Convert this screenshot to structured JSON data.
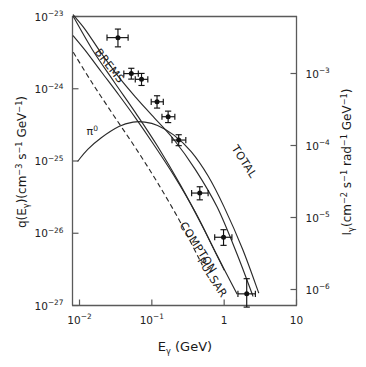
{
  "figure": {
    "background_color": "#ffffff",
    "line_color": "#2a2a2a",
    "axis_color": "#5a5a5a",
    "marker_color": "#111111"
  },
  "axes": {
    "x": {
      "label_parts": {
        "symbol": "E",
        "subscript": "γ",
        "units": "(GeV)"
      },
      "label_text": "Eγ (GeV)",
      "scale": "log",
      "range": [
        0.008,
        10
      ],
      "ticks": [
        {
          "value": 0.01,
          "mantissa": "10",
          "exponent": "-2"
        },
        {
          "value": 0.1,
          "mantissa": "10",
          "exponent": "-1"
        },
        {
          "value": 1,
          "mantissa": "1",
          "exponent": ""
        },
        {
          "value": 10,
          "mantissa": "10",
          "exponent": ""
        }
      ]
    },
    "y_left": {
      "label_text": "q(Eγ)(cm⁻³ s⁻¹ GeV⁻¹)",
      "scale": "log",
      "range": [
        1e-27,
        1e-23
      ],
      "ticks": [
        {
          "mantissa": "10",
          "exponent": "-23"
        },
        {
          "mantissa": "10",
          "exponent": "-24"
        },
        {
          "mantissa": "10",
          "exponent": "-25"
        },
        {
          "mantissa": "10",
          "exponent": "-26"
        },
        {
          "mantissa": "10",
          "exponent": "-27"
        }
      ]
    },
    "y_right": {
      "label_text": "Iγ(cm⁻² s⁻¹ rad⁻¹ GeV⁻¹)",
      "scale": "log",
      "ticks": [
        {
          "mantissa": "10",
          "exponent": "-3"
        },
        {
          "mantissa": "10",
          "exponent": "-4"
        },
        {
          "mantissa": "10",
          "exponent": "-5"
        },
        {
          "mantissa": "10",
          "exponent": "-6"
        }
      ]
    }
  },
  "chart_data": {
    "type": "line",
    "title": "",
    "xlabel": "Eγ (GeV)",
    "ylabel": "q(Eγ)(cm⁻³ s⁻¹ GeV⁻¹)",
    "ylabel_right": "Iγ(cm⁻² s⁻¹ rad⁻¹ GeV⁻¹)",
    "xscale": "log",
    "yscale": "log",
    "xlim": [
      0.008,
      10
    ],
    "ylim": [
      1e-27,
      1e-23
    ],
    "grid": false,
    "legend": "inline-curve-labels",
    "annotations": [
      {
        "text": "BREMS",
        "x": 0.016,
        "y": 3.2e-24,
        "rotation": 52
      },
      {
        "text": "π⁰",
        "x": 0.0125,
        "y": 2.3e-25,
        "rotation": 0
      },
      {
        "text": "COMPTON",
        "x": 0.24,
        "y": 1.3e-26,
        "rotation": 57
      },
      {
        "text": "PULSAR",
        "x": 0.42,
        "y": 4.2e-27,
        "rotation": 57
      },
      {
        "text": "TOTAL",
        "x": 1.25,
        "y": 1.5e-25,
        "rotation": 57
      }
    ],
    "series": [
      {
        "name": "BREMS",
        "style": "solid",
        "x": [
          0.0082,
          0.012,
          0.02,
          0.035,
          0.06,
          0.1,
          0.2,
          0.4,
          0.8,
          1.5,
          2.5,
          3.6
        ],
        "y": [
          5.4e-24,
          3.4e-24,
          1.72e-24,
          8.2e-25,
          3.9e-25,
          1.85e-25,
          6.4e-26,
          1.95e-26,
          4.9e-27,
          1.45e-27,
          4.6e-28,
          2e-28
        ]
      },
      {
        "name": "PI0",
        "style": "solid",
        "x": [
          0.0095,
          0.013,
          0.02,
          0.035,
          0.055,
          0.08,
          0.12,
          0.2,
          0.35,
          0.6,
          1.0,
          1.8,
          3.0,
          4.3
        ],
        "y": [
          1e-25,
          1.45e-25,
          2.1e-25,
          3e-25,
          3.45e-25,
          3.45e-25,
          3.1e-25,
          2.3e-25,
          1.35e-25,
          6.2e-26,
          2.3e-26,
          6e-27,
          1.5e-27,
          5.5e-28
        ]
      },
      {
        "name": "COMPTON",
        "style": "solid",
        "x": [
          0.0082,
          0.015,
          0.03,
          0.06,
          0.12,
          0.25,
          0.5,
          1.0,
          1.8,
          2.8,
          3.6
        ],
        "y": [
          1e-23,
          3.5e-24,
          1.25e-24,
          4.6e-25,
          1.6e-25,
          4.6e-26,
          1.25e-26,
          3.1e-27,
          8.5e-28,
          2.7e-28,
          1.4e-28
        ]
      },
      {
        "name": "PULSAR",
        "style": "dashed",
        "x": [
          0.0082,
          0.015,
          0.03,
          0.06,
          0.12,
          0.25,
          0.5,
          1.0,
          1.6,
          2.3
        ],
        "y": [
          3.2e-24,
          1.2e-24,
          4.2e-25,
          1.5e-25,
          5e-26,
          1.4e-26,
          3.6e-27,
          8.5e-28,
          3e-28,
          1.2e-28
        ]
      },
      {
        "name": "TOTAL",
        "style": "solid",
        "x": [
          0.0082,
          0.012,
          0.02,
          0.035,
          0.06,
          0.1,
          0.2,
          0.4,
          0.8,
          1.5,
          2.5,
          4.0
        ],
        "y": [
          1.05e-23,
          6.6e-24,
          3.1e-24,
          1.45e-24,
          7.6e-25,
          4.3e-25,
          2e-25,
          7.6e-26,
          2.3e-26,
          5.2e-27,
          1.35e-27,
          3e-28
        ]
      }
    ],
    "data_points": [
      {
        "x": 0.034,
        "y": 5.1e-24,
        "xerr_lo": 0.01,
        "xerr_hi": 0.013,
        "yerr_lo": 1.3e-24,
        "yerr_hi": 1.6e-24
      },
      {
        "x": 0.052,
        "y": 1.62e-24,
        "xerr_lo": 0.011,
        "xerr_hi": 0.013,
        "yerr_lo": 2.6e-25,
        "yerr_hi": 3e-25
      },
      {
        "x": 0.072,
        "y": 1.35e-24,
        "xerr_lo": 0.013,
        "xerr_hi": 0.016,
        "yerr_lo": 2.4e-25,
        "yerr_hi": 2.8e-25
      },
      {
        "x": 0.118,
        "y": 6.6e-25,
        "xerr_lo": 0.02,
        "xerr_hi": 0.026,
        "yerr_lo": 1.2e-25,
        "yerr_hi": 1.4e-25
      },
      {
        "x": 0.168,
        "y": 4.1e-25,
        "xerr_lo": 0.03,
        "xerr_hi": 0.04,
        "yerr_lo": 7e-26,
        "yerr_hi": 8e-26
      },
      {
        "x": 0.235,
        "y": 1.95e-25,
        "xerr_lo": 0.045,
        "xerr_hi": 0.06,
        "yerr_lo": 3.2e-26,
        "yerr_hi": 3.6e-26
      },
      {
        "x": 0.46,
        "y": 3.6e-26,
        "xerr_lo": 0.105,
        "xerr_hi": 0.14,
        "yerr_lo": 7e-27,
        "yerr_hi": 8e-27
      },
      {
        "x": 0.98,
        "y": 8.8e-27,
        "xerr_lo": 0.24,
        "xerr_hi": 0.3,
        "yerr_lo": 2e-27,
        "yerr_hi": 2.4e-27
      },
      {
        "x": 2.05,
        "y": 1.45e-27,
        "xerr_lo": 0.5,
        "xerr_hi": 0.65,
        "yerr_lo": 5e-28,
        "yerr_hi": 9e-28
      }
    ]
  }
}
